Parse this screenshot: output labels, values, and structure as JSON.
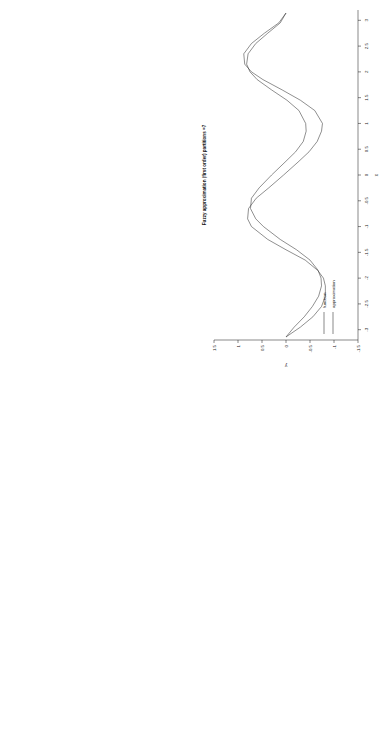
{
  "figure": {
    "layout": "2x2 grid of rotated plots",
    "rotation_deg": -90,
    "background": "#ffffff",
    "line_color": "#333333",
    "axis_color": "#111111"
  },
  "panels": [
    {
      "id": "top-left",
      "title": "Fuzzy approximation (second order) partitions =7",
      "xlabel": "x",
      "ylabel": "y",
      "xticks": [
        "-3",
        "-2.5",
        "-2",
        "-1.5",
        "-1",
        "-0.5",
        "0",
        "0.5",
        "1",
        "1.5",
        "2",
        "2.5",
        "3"
      ],
      "yticks": [
        "-1.5",
        "-1",
        "-0.5",
        "0",
        "0.5",
        "1",
        "1.5"
      ],
      "legend": [
        "function",
        "approximation"
      ]
    },
    {
      "id": "top-right",
      "title": "",
      "xlabel": "x",
      "ylabel": "Approx. error",
      "xticks": [
        "-3",
        "-2.5",
        "-2",
        "-1.5",
        "-1",
        "-0.5",
        "0",
        "0.5",
        "1",
        "1.5",
        "2",
        "2.5",
        "3"
      ],
      "yticks": [
        "0",
        "0.1",
        "0.2",
        "0.3",
        "0.4",
        "0.5"
      ],
      "legend": []
    },
    {
      "id": "bottom-left",
      "title": "Fuzzy approximation (first order) partitions =7",
      "xlabel": "x",
      "ylabel": "y",
      "xticks": [
        "-3",
        "-2.5",
        "-2",
        "-1.5",
        "-1",
        "-0.5",
        "0",
        "0.5",
        "1",
        "1.5",
        "2",
        "2.5",
        "3"
      ],
      "yticks": [
        "-1.5",
        "-1",
        "-0.5",
        "0",
        "0.5",
        "1",
        "1.5"
      ],
      "legend": [
        "function",
        "approximation"
      ]
    },
    {
      "id": "bottom-right",
      "title": "",
      "xlabel": "x",
      "ylabel": "Approx. error",
      "xticks": [
        "-3",
        "-2.5",
        "-2",
        "-1.5",
        "-1",
        "-0.5",
        "0",
        "0.5",
        "1",
        "1.5",
        "2",
        "2.5",
        "3"
      ],
      "yticks": [
        "0",
        "0.1",
        "0.2",
        "0.3",
        "0.4",
        "0.5"
      ],
      "legend": []
    }
  ],
  "chart_data": [
    {
      "id": "top-left",
      "type": "line",
      "title": "Fuzzy approximation (second order) partitions =7",
      "xlabel": "x",
      "ylabel": "y",
      "xlim": [
        -3.2,
        3.2
      ],
      "ylim": [
        -1.5,
        1.5
      ],
      "grid": false,
      "legend": [
        "function",
        "approximation"
      ],
      "legend_position": "bottom-left",
      "x": [
        -3.14159,
        -2.95,
        -2.75,
        -2.55,
        -2.35,
        -2.15,
        -2.0,
        -1.85,
        -1.65,
        -1.45,
        -1.25,
        -1.0,
        -0.85,
        -0.65,
        -0.45,
        -0.25,
        0.0,
        0.25,
        0.45,
        0.65,
        0.85,
        1.0,
        1.25,
        1.45,
        1.65,
        1.85,
        2.0,
        2.15,
        2.35,
        2.55,
        2.75,
        2.95,
        3.14159
      ],
      "series": [
        {
          "name": "function",
          "values": [
            0.0,
            -0.17,
            -0.38,
            -0.55,
            -0.68,
            -0.74,
            -0.73,
            -0.67,
            -0.5,
            -0.22,
            0.12,
            0.47,
            0.63,
            0.74,
            0.72,
            0.56,
            0.3,
            0.02,
            -0.2,
            -0.36,
            -0.42,
            -0.41,
            -0.27,
            -0.02,
            0.3,
            0.6,
            0.75,
            0.82,
            0.79,
            0.63,
            0.38,
            0.12,
            0.0
          ]
        },
        {
          "name": "approximation",
          "values": [
            0.0,
            -0.22,
            -0.44,
            -0.6,
            -0.72,
            -0.76,
            -0.74,
            -0.66,
            -0.46,
            -0.16,
            0.18,
            0.52,
            0.66,
            0.74,
            0.7,
            0.52,
            0.26,
            -0.02,
            -0.24,
            -0.4,
            -0.46,
            -0.44,
            -0.3,
            -0.04,
            0.28,
            0.62,
            0.79,
            0.86,
            0.82,
            0.66,
            0.4,
            0.14,
            0.02
          ]
        }
      ]
    },
    {
      "id": "top-right",
      "type": "line",
      "title": "",
      "xlabel": "x",
      "ylabel": "Approx. error",
      "xlim": [
        -3.2,
        3.2
      ],
      "ylim": [
        0,
        0.55
      ],
      "grid": false,
      "x": [
        -3.14159,
        -3.0,
        -2.85,
        -2.7,
        -2.55,
        -2.4,
        -2.25,
        -2.1,
        -1.95,
        -1.8,
        -1.65,
        -1.5,
        -1.35,
        -1.2,
        -1.05,
        -0.9,
        -0.75,
        -0.6,
        -0.45,
        -0.3,
        -0.15,
        0.0,
        0.15,
        0.3,
        0.45,
        0.6,
        0.75,
        0.9,
        1.05,
        1.2,
        1.35,
        1.5,
        1.65,
        1.8,
        1.95,
        2.1,
        2.25,
        2.4,
        2.55,
        2.7,
        2.85,
        3.0,
        3.14159
      ],
      "series": [
        {
          "name": "approx error",
          "values": [
            0.0,
            0.05,
            0.1,
            0.11,
            0.05,
            0.0,
            0.09,
            0.17,
            0.12,
            0.03,
            0.0,
            0.13,
            0.23,
            0.25,
            0.14,
            0.0,
            0.07,
            0.12,
            0.11,
            0.06,
            0.02,
            0.0,
            0.03,
            0.08,
            0.12,
            0.13,
            0.1,
            0.04,
            0.0,
            0.12,
            0.23,
            0.25,
            0.14,
            0.0,
            0.08,
            0.16,
            0.15,
            0.07,
            0.0,
            0.06,
            0.11,
            0.1,
            0.04
          ]
        }
      ]
    },
    {
      "id": "bottom-left",
      "type": "line",
      "title": "Fuzzy approximation (first order) partitions =7",
      "xlabel": "x",
      "ylabel": "y",
      "xlim": [
        -3.2,
        3.2
      ],
      "ylim": [
        -1.5,
        1.5
      ],
      "grid": false,
      "legend": [
        "function",
        "approximation"
      ],
      "legend_position": "bottom-left",
      "x": [
        -3.14159,
        -2.95,
        -2.75,
        -2.55,
        -2.35,
        -2.15,
        -2.0,
        -1.85,
        -1.65,
        -1.45,
        -1.25,
        -1.0,
        -0.85,
        -0.65,
        -0.45,
        -0.25,
        0.0,
        0.25,
        0.45,
        0.65,
        0.85,
        1.0,
        1.25,
        1.45,
        1.65,
        1.85,
        2.0,
        2.15,
        2.35,
        2.55,
        2.75,
        2.95,
        3.14159
      ],
      "series": [
        {
          "name": "function",
          "values": [
            0.0,
            -0.17,
            -0.38,
            -0.55,
            -0.68,
            -0.74,
            -0.73,
            -0.67,
            -0.5,
            -0.22,
            0.12,
            0.47,
            0.63,
            0.74,
            0.72,
            0.56,
            0.3,
            0.02,
            -0.2,
            -0.36,
            -0.42,
            -0.41,
            -0.27,
            -0.02,
            0.3,
            0.6,
            0.75,
            0.82,
            0.79,
            0.63,
            0.38,
            0.12,
            0.0
          ]
        },
        {
          "name": "approximation",
          "values": [
            0.0,
            -0.3,
            -0.56,
            -0.74,
            -0.82,
            -0.82,
            -0.78,
            -0.66,
            -0.4,
            0.0,
            0.38,
            0.72,
            0.8,
            0.78,
            0.62,
            0.36,
            0.05,
            -0.25,
            -0.48,
            -0.65,
            -0.74,
            -0.76,
            -0.6,
            -0.3,
            0.08,
            0.48,
            0.72,
            0.86,
            0.88,
            0.72,
            0.45,
            0.15,
            0.0
          ]
        }
      ]
    },
    {
      "id": "bottom-right",
      "type": "line",
      "title": "",
      "xlabel": "x",
      "ylabel": "Approx. error",
      "xlim": [
        -3.2,
        3.2
      ],
      "ylim": [
        0,
        0.55
      ],
      "grid": false,
      "x": [
        -3.14159,
        -3.0,
        -2.85,
        -2.7,
        -2.55,
        -2.4,
        -2.25,
        -2.1,
        -1.95,
        -1.8,
        -1.65,
        -1.5,
        -1.35,
        -1.2,
        -1.05,
        -0.9,
        -0.75,
        -0.6,
        -0.45,
        -0.3,
        -0.15,
        0.0,
        0.15,
        0.3,
        0.45,
        0.6,
        0.75,
        0.9,
        1.05,
        1.2,
        1.35,
        1.5,
        1.65,
        1.8,
        1.95,
        2.1,
        2.25,
        2.4,
        2.55,
        2.7,
        2.85,
        3.0,
        3.14159
      ],
      "series": [
        {
          "name": "approx error",
          "values": [
            0.0,
            0.16,
            0.36,
            0.46,
            0.44,
            0.31,
            0.14,
            0.0,
            0.14,
            0.23,
            0.22,
            0.12,
            0.0,
            0.14,
            0.2,
            0.14,
            0.0,
            0.2,
            0.38,
            0.45,
            0.4,
            0.26,
            0.06,
            0.2,
            0.36,
            0.42,
            0.36,
            0.2,
            0.0,
            0.15,
            0.23,
            0.24,
            0.14,
            0.0,
            0.13,
            0.22,
            0.2,
            0.1,
            0.0,
            0.2,
            0.38,
            0.46,
            0.44
          ]
        }
      ]
    }
  ]
}
